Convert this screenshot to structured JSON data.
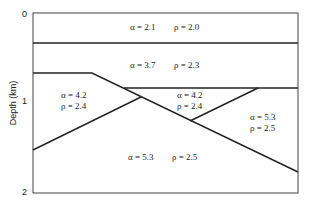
{
  "axis": {
    "title": "Depth (km)",
    "ticks": [
      "0",
      "1",
      "2"
    ]
  },
  "layers": [
    {
      "alpha": "α = 2.1",
      "rho": "ρ = 2.0"
    },
    {
      "alpha": "α = 3.7",
      "rho": "ρ = 2.3"
    },
    {
      "alpha": "α = 4.2",
      "rho": "ρ = 2.4"
    },
    {
      "alpha": "α = 4.2",
      "rho": "ρ = 2.4"
    },
    {
      "alpha": "α = 5.3",
      "rho": "ρ = 2.5"
    },
    {
      "alpha": "α = 5.3",
      "rho": "ρ = 2.5"
    }
  ],
  "colors": {
    "line": "#222222",
    "background": "#ffffff"
  }
}
